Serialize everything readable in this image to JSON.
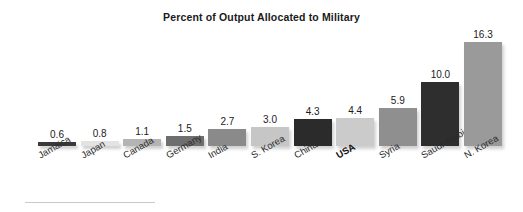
{
  "chart_data": {
    "type": "bar",
    "title": "Percent of Output Allocated to Military",
    "xlabel": "",
    "ylabel": "",
    "ylim": [
      0,
      16.3
    ],
    "grid": false,
    "legend": null,
    "value_label_format": "one-decimal",
    "categories": [
      "Jamaica",
      "Japan",
      "Canada",
      "Germany",
      "India",
      "S. Korea",
      "China",
      "USA",
      "Syria",
      "Saudi Arabia",
      "N. Korea"
    ],
    "values": [
      0.6,
      0.8,
      1.1,
      1.5,
      2.7,
      3.0,
      4.3,
      4.4,
      5.9,
      10.0,
      16.3
    ],
    "value_labels": [
      "0.6",
      "0.8",
      "1.1",
      "1.5",
      "2.7",
      "3.0",
      "4.3",
      "4.4",
      "5.9",
      "10.0",
      "16.3"
    ],
    "bar_colors": [
      "#3a3a3a",
      "#e3e3e3",
      "#b4b4b4",
      "#6e6e6e",
      "#8a8a8a",
      "#c6c6c6",
      "#2b2b2b",
      "#cbcbcb",
      "#8f8f8f",
      "#2e2e2e",
      "#9a9a9a"
    ],
    "highlighted_category": "USA"
  },
  "colors": {
    "background": "#ffffff",
    "title": "#1a1a1a",
    "label": "#2b2b2b",
    "rule": "#c9c9c9"
  }
}
